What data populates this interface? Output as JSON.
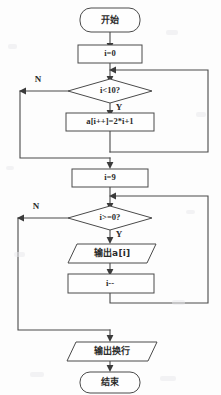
{
  "diagram": {
    "type": "flowchart",
    "orientation": "vertical",
    "background_color": "#fdfdfd",
    "line_color": "#4a4a4a",
    "text_color": "#2b2b2b"
  },
  "nodes": {
    "start": {
      "label": "开始",
      "shape": "terminator"
    },
    "init_i": {
      "label": "i=0",
      "shape": "process"
    },
    "cond_lt10": {
      "label": "i<10?",
      "shape": "decision"
    },
    "assign_arr": {
      "label": "a[i++]=2*i+1",
      "shape": "process"
    },
    "set_i9": {
      "label": "i=9",
      "shape": "process"
    },
    "cond_ge0": {
      "label": "i>=0?",
      "shape": "decision"
    },
    "print_ai": {
      "label": "输出a[i]",
      "shape": "io-parallelogram"
    },
    "dec_i": {
      "label": "i--",
      "shape": "process"
    },
    "print_nl": {
      "label": "输出换行",
      "shape": "io-parallelogram"
    },
    "end": {
      "label": "结束",
      "shape": "terminator"
    }
  },
  "branch_labels": {
    "loop1_no": "N",
    "loop1_yes": "Y",
    "loop2_no": "N",
    "loop2_yes": "Y"
  }
}
